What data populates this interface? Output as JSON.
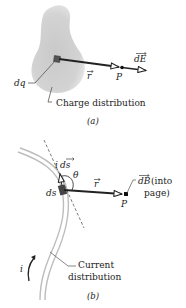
{
  "panel_a": {
    "caption": "(a)",
    "element_label": "dq",
    "vector_r_label": "r",
    "point_label": "P",
    "field_label": "dE",
    "distribution_label": "Charge distribution"
  },
  "panel_b": {
    "caption": "(b)",
    "element_label": "ds",
    "current_element_label_i": "i",
    "current_element_label_ds": "ds",
    "angle_label": "θ",
    "vector_r_label": "r",
    "point_label": "P",
    "field_label": "dB",
    "field_note_line1": "(into",
    "field_note_line2": "page)",
    "current_label": "i",
    "distribution_label_line1": "Current",
    "distribution_label_line2": "distribution"
  },
  "colors": {
    "blob_fill": "#cdcdcd",
    "wire": "#bdbdbd",
    "vector": "#222222",
    "text": "#222222"
  }
}
